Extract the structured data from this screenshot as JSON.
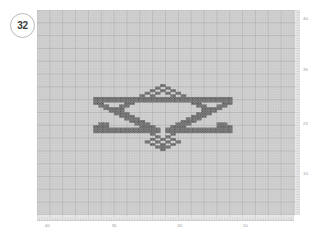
{
  "app": {
    "title": "Pattern Grid Editor",
    "background_color": "#ffffff"
  },
  "badge": {
    "name": "pattern-number-badge",
    "value": "32",
    "border_color": "#b9b9b9",
    "text_color": "#3b3b3b"
  },
  "canvas": {
    "name": "pattern-canvas",
    "background_color": "#d2d2d2",
    "grid_minor_color": "#c4c4c4",
    "grid_major_color": "#b0b0b0",
    "cell_size_px": 2.57,
    "major_every": 5,
    "cols": 100,
    "rows": 80,
    "left_px": 37,
    "top_px": 10,
    "width_px": 257,
    "height_px": 205
  },
  "stitch": {
    "name": "stitch-cell",
    "fill_color": "#8a8a8a",
    "stroke_color": "#5c5c5c",
    "symbol_color": "#4a4a4a"
  },
  "ruler": {
    "bottom_name": "horizontal-ruler",
    "right_name": "vertical-ruler",
    "tick_color": "#b5b5b5",
    "label_color": "#9a9a9a"
  },
  "axes": {
    "x_ticks": [
      {
        "label": "40",
        "pos": 0.04
      },
      {
        "label": "30",
        "pos": 0.3
      },
      {
        "label": "20",
        "pos": 0.555
      },
      {
        "label": "10",
        "pos": 0.81
      }
    ],
    "y_ticks": [
      {
        "label": "40",
        "pos": 0.045
      },
      {
        "label": "35",
        "pos": 0.295
      },
      {
        "label": "25",
        "pos": 0.555
      },
      {
        "label": "10",
        "pos": 0.8
      }
    ]
  },
  "chart_data": {
    "type": "heatmap",
    "xlabel": "",
    "ylabel": "",
    "grid": true,
    "legend": "none",
    "cols": 100,
    "rows": 80,
    "categories": [],
    "values": [],
    "filled_cells_runs": [
      {
        "row": 29,
        "cols": [
          48,
          49
        ]
      },
      {
        "row": 30,
        "cols": [
          46,
          47
        ]
      },
      {
        "row": 30,
        "cols": [
          50,
          51
        ]
      },
      {
        "row": 31,
        "cols": [
          44,
          45
        ]
      },
      {
        "row": 31,
        "cols": [
          48,
          49
        ]
      },
      {
        "row": 31,
        "cols": [
          52,
          53
        ]
      },
      {
        "row": 32,
        "cols": [
          42,
          43
        ]
      },
      {
        "row": 32,
        "cols": [
          46,
          47
        ]
      },
      {
        "row": 32,
        "cols": [
          50,
          51
        ]
      },
      {
        "row": 32,
        "cols": [
          54,
          55
        ]
      },
      {
        "row": 33,
        "cols": [
          40,
          41
        ]
      },
      {
        "row": 33,
        "cols": [
          44,
          45
        ]
      },
      {
        "row": 33,
        "cols": [
          52,
          53
        ]
      },
      {
        "row": 33,
        "cols": [
          56,
          57
        ]
      },
      {
        "row": 34,
        "cols": [
          22,
          75
        ]
      },
      {
        "row": 35,
        "cols": [
          22,
          75
        ]
      },
      {
        "row": 36,
        "cols": [
          22,
          25
        ]
      },
      {
        "row": 36,
        "cols": [
          34,
          37
        ]
      },
      {
        "row": 36,
        "cols": [
          60,
          63
        ]
      },
      {
        "row": 36,
        "cols": [
          72,
          75
        ]
      },
      {
        "row": 37,
        "cols": [
          24,
          27
        ]
      },
      {
        "row": 37,
        "cols": [
          32,
          35
        ]
      },
      {
        "row": 37,
        "cols": [
          62,
          65
        ]
      },
      {
        "row": 37,
        "cols": [
          70,
          73
        ]
      },
      {
        "row": 38,
        "cols": [
          26,
          29
        ]
      },
      {
        "row": 38,
        "cols": [
          30,
          33
        ]
      },
      {
        "row": 38,
        "cols": [
          64,
          67
        ]
      },
      {
        "row": 38,
        "cols": [
          68,
          71
        ]
      },
      {
        "row": 39,
        "cols": [
          28,
          33
        ]
      },
      {
        "row": 39,
        "cols": [
          64,
          69
        ]
      },
      {
        "row": 40,
        "cols": [
          30,
          35
        ]
      },
      {
        "row": 40,
        "cols": [
          62,
          67
        ]
      },
      {
        "row": 41,
        "cols": [
          32,
          37
        ]
      },
      {
        "row": 41,
        "cols": [
          60,
          65
        ]
      },
      {
        "row": 42,
        "cols": [
          34,
          39
        ]
      },
      {
        "row": 42,
        "cols": [
          58,
          63
        ]
      },
      {
        "row": 43,
        "cols": [
          36,
          41
        ]
      },
      {
        "row": 43,
        "cols": [
          56,
          61
        ]
      },
      {
        "row": 44,
        "cols": [
          24,
          27
        ]
      },
      {
        "row": 44,
        "cols": [
          38,
          43
        ]
      },
      {
        "row": 44,
        "cols": [
          54,
          59
        ]
      },
      {
        "row": 44,
        "cols": [
          70,
          73
        ]
      },
      {
        "row": 45,
        "cols": [
          22,
          27
        ]
      },
      {
        "row": 45,
        "cols": [
          40,
          45
        ]
      },
      {
        "row": 45,
        "cols": [
          52,
          57
        ]
      },
      {
        "row": 45,
        "cols": [
          70,
          75
        ]
      },
      {
        "row": 46,
        "cols": [
          22,
          47
        ]
      },
      {
        "row": 46,
        "cols": [
          50,
          75
        ]
      },
      {
        "row": 47,
        "cols": [
          22,
          47
        ]
      },
      {
        "row": 47,
        "cols": [
          50,
          75
        ]
      },
      {
        "row": 48,
        "cols": [
          44,
          45
        ]
      },
      {
        "row": 48,
        "cols": [
          52,
          53
        ]
      },
      {
        "row": 49,
        "cols": [
          46,
          47
        ]
      },
      {
        "row": 49,
        "cols": [
          50,
          51
        ]
      },
      {
        "row": 50,
        "cols": [
          44,
          45
        ]
      },
      {
        "row": 50,
        "cols": [
          48,
          49
        ]
      },
      {
        "row": 50,
        "cols": [
          52,
          53
        ]
      },
      {
        "row": 51,
        "cols": [
          42,
          43
        ]
      },
      {
        "row": 51,
        "cols": [
          46,
          47
        ]
      },
      {
        "row": 51,
        "cols": [
          50,
          51
        ]
      },
      {
        "row": 51,
        "cols": [
          54,
          55
        ]
      },
      {
        "row": 52,
        "cols": [
          44,
          45
        ]
      },
      {
        "row": 52,
        "cols": [
          48,
          49
        ]
      },
      {
        "row": 52,
        "cols": [
          52,
          53
        ]
      },
      {
        "row": 53,
        "cols": [
          46,
          51
        ]
      },
      {
        "row": 54,
        "cols": [
          48,
          49
        ]
      }
    ]
  }
}
